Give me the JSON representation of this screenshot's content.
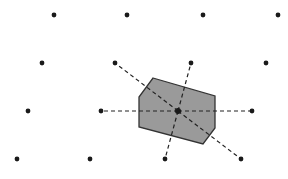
{
  "diagram": {
    "colors": {
      "background": "#ffffff",
      "point": "#1a1a1a",
      "cell_fill": "#9a9a9a",
      "cell_stroke": "#333333",
      "dash": "#222222"
    },
    "lattice_points": [
      [
        54,
        15
      ],
      [
        127,
        15
      ],
      [
        203,
        15
      ],
      [
        278,
        15
      ],
      [
        42,
        63
      ],
      [
        115,
        63
      ],
      [
        191,
        63
      ],
      [
        266,
        63
      ],
      [
        28,
        111
      ],
      [
        101,
        111
      ],
      [
        178,
        111
      ],
      [
        252,
        111
      ],
      [
        17,
        159
      ],
      [
        90,
        159
      ],
      [
        165,
        159
      ],
      [
        241,
        159
      ]
    ],
    "center_point": [
      178,
      111
    ],
    "cell_polygon": [
      [
        153,
        78
      ],
      [
        215,
        96
      ],
      [
        215,
        128
      ],
      [
        203,
        144
      ],
      [
        139,
        127
      ],
      [
        139,
        97
      ]
    ],
    "neighbor_links": [
      [
        [
          178,
          111
        ],
        [
          115,
          63
        ]
      ],
      [
        [
          178,
          111
        ],
        [
          191,
          63
        ]
      ],
      [
        [
          178,
          111
        ],
        [
          101,
          111
        ]
      ],
      [
        [
          178,
          111
        ],
        [
          252,
          111
        ]
      ],
      [
        [
          178,
          111
        ],
        [
          165,
          159
        ]
      ],
      [
        [
          178,
          111
        ],
        [
          241,
          159
        ]
      ]
    ]
  }
}
